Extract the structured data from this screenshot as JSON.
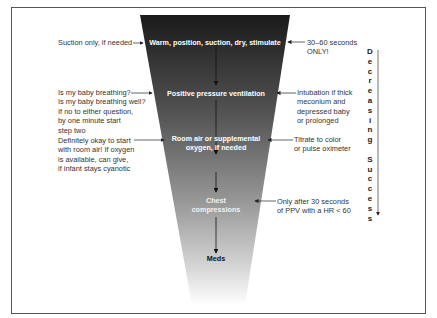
{
  "diagram": {
    "steps": [
      {
        "label": "Warm, position, suction, dry, stimulate"
      },
      {
        "label": "Positive pressure ventilation"
      },
      {
        "label_line1": "Room air or supplemental",
        "label_line2": "oxygen, if needed"
      },
      {
        "label_line1": "Chest",
        "label_line2": "compressions"
      },
      {
        "label": "Meds"
      }
    ],
    "left_notes": [
      {
        "lines": [
          "Suction only, if needed"
        ]
      },
      {
        "lines": [
          "Is my baby breathing?",
          "Is my baby breathing well?",
          "If no to either question,",
          "by one minute start",
          "step two"
        ]
      },
      {
        "lines": [
          "Definitely okay to start",
          "with room air! If oxygen",
          "is available, can give,",
          "if infant stays cyanotic"
        ]
      }
    ],
    "right_notes": [
      {
        "lines": [
          "30–60 seconds",
          "ONLY!"
        ]
      },
      {
        "lines": [
          "Intubation if thick",
          "meconium and",
          "depressed baby",
          "or prolonged"
        ]
      },
      {
        "lines": [
          "Titrate to color",
          "or pulse oximeter"
        ]
      },
      {
        "lines": [
          "Only after 30 seconds",
          "of PPV with a HR < 60"
        ]
      }
    ],
    "side_label": [
      "D",
      "e",
      "c",
      "r",
      "e",
      "a",
      "s",
      "i",
      "n",
      "g",
      "",
      "S",
      "u",
      "c",
      "c",
      "e",
      "s",
      "s"
    ],
    "colors": {
      "funnel_top": "#1a1a1a",
      "funnel_mid": "#8a8a8a",
      "funnel_bottom": "#ffffff",
      "border": "#555555"
    }
  }
}
